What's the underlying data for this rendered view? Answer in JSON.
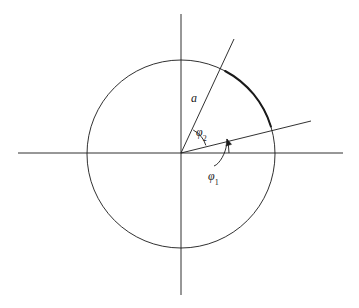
{
  "figure": {
    "kind": "geometry-diagram",
    "background_color": "#ffffff",
    "stroke_color": "#1a1a1a",
    "width": 359,
    "height": 308
  },
  "axes": {
    "origin": {
      "x": 181,
      "y": 153
    },
    "horizontal": {
      "x1": 18,
      "y1": 153,
      "x2": 343,
      "y2": 153,
      "stroke_width": 0.9
    },
    "vertical": {
      "x1": 181,
      "y1": 14,
      "x2": 181,
      "y2": 295,
      "stroke_width": 0.9
    }
  },
  "circle": {
    "cx": 181,
    "cy": 154,
    "r": 94,
    "stroke_width": 0.9,
    "label": "a"
  },
  "arc_highlight": {
    "description": "bold arc between the two rays",
    "start": {
      "x": 220,
      "y": 71
    },
    "end": {
      "x": 272,
      "y": 128
    },
    "stroke_width": 2.0
  },
  "rays": [
    {
      "name": "ray-phi2",
      "angle_deg": 62,
      "from": {
        "x": 181,
        "y": 153
      },
      "to": {
        "x": 234,
        "y": 39
      },
      "stroke_width": 0.9
    },
    {
      "name": "ray-phi1",
      "angle_deg": 17,
      "from": {
        "x": 181,
        "y": 153
      },
      "to": {
        "x": 311,
        "y": 121
      },
      "stroke_width": 0.9
    }
  ],
  "angle_arcs": [
    {
      "name": "angle-arc-phi2",
      "radius": 26,
      "from_angle_deg": 17,
      "to_angle_deg": 62,
      "stroke_width": 0.9
    },
    {
      "name": "angle-arc-phi1",
      "radius": 48,
      "from_angle_deg": 0,
      "to_angle_deg": 17,
      "stroke_width": 0.9,
      "has_arrowhead": true
    }
  ],
  "leader": {
    "name": "phi1-leader",
    "description": "curved leader line from phi1 label up to the phi1 angle arrow",
    "stroke_width": 0.9
  },
  "labels": {
    "radius": {
      "text": "a",
      "x": 191,
      "y": 92
    },
    "phi2": {
      "base": "φ",
      "sub": "2",
      "x": 196,
      "y": 126
    },
    "phi1": {
      "base": "φ",
      "sub": "1",
      "x": 208,
      "y": 170
    }
  }
}
